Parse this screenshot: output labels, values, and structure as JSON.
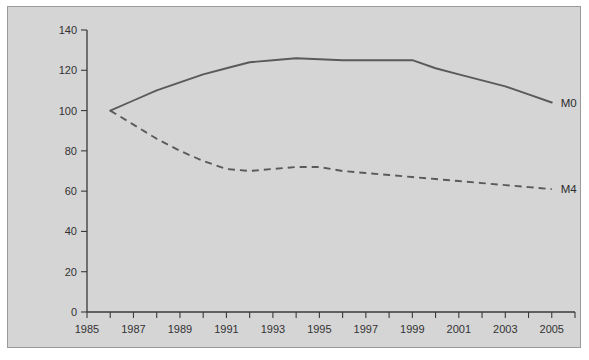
{
  "chart_data": {
    "type": "line",
    "title": "",
    "subtitle": "",
    "xlabel": "",
    "ylabel": "",
    "xlim": [
      1985,
      2006
    ],
    "ylim": [
      0,
      140
    ],
    "grid": false,
    "legend_position": "right-inline-labels",
    "y_ticks": [
      0,
      20,
      40,
      60,
      80,
      100,
      120,
      140
    ],
    "y_tick_labels": [
      "0",
      "20",
      "40",
      "60",
      "80",
      "100",
      "120",
      "140"
    ],
    "x_ticks": [
      1985,
      1986,
      1987,
      1988,
      1989,
      1990,
      1991,
      1992,
      1993,
      1994,
      1995,
      1996,
      1997,
      1998,
      1999,
      2000,
      2001,
      2002,
      2003,
      2004,
      2005,
      2006
    ],
    "x_tick_labels": [
      "1985",
      "",
      "1987",
      "",
      "1989",
      "",
      "1991",
      "",
      "1993",
      "",
      "1995",
      "",
      "1997",
      "",
      "1999",
      "",
      "2001",
      "",
      "2003",
      "",
      "2005",
      ""
    ],
    "x": [
      1986,
      1987,
      1988,
      1989,
      1990,
      1991,
      1992,
      1993,
      1994,
      1995,
      1996,
      1997,
      1998,
      1999,
      2000,
      2001,
      2002,
      2003,
      2004,
      2005
    ],
    "series": [
      {
        "name": "M0",
        "style": "solid",
        "color": "#5a5a5a",
        "label": "M0",
        "values": [
          100,
          105,
          110,
          114,
          118,
          121,
          124,
          125,
          126,
          125.5,
          125,
          125,
          125,
          125,
          121,
          118,
          115,
          112,
          108,
          104
        ]
      },
      {
        "name": "M4",
        "style": "dashed",
        "color": "#5a5a5a",
        "label": "M4",
        "values": [
          100,
          93,
          86,
          80,
          75,
          71,
          70,
          71,
          72,
          72,
          70,
          69,
          68,
          67,
          66,
          65,
          64,
          63,
          62,
          61
        ]
      }
    ]
  }
}
